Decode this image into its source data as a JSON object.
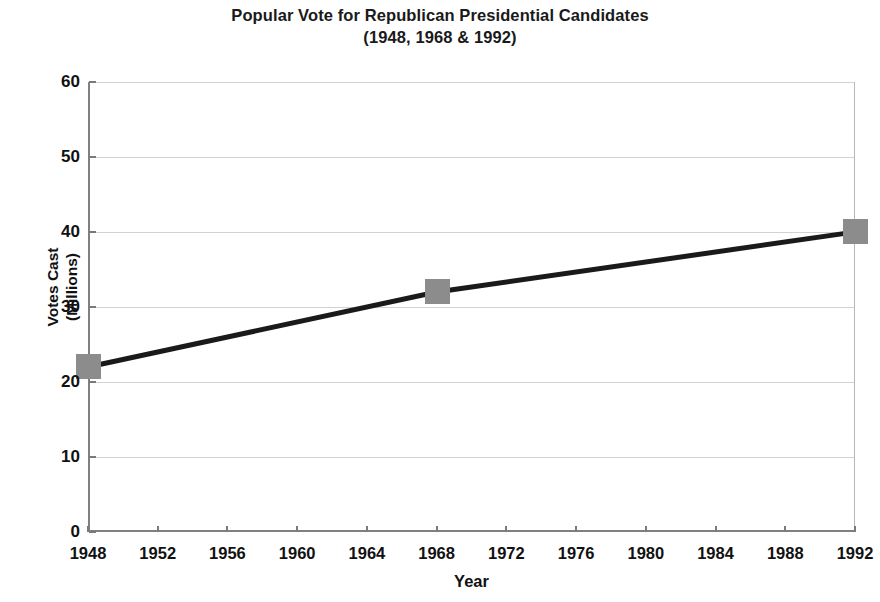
{
  "chart_data": {
    "type": "line",
    "title": "Popular Vote for Republican Presidential Candidates",
    "subtitle": "(1948, 1968 & 1992)",
    "xlabel": "Year",
    "ylabel": "Votes Cast",
    "ylabel_line2": "(Millions)",
    "x": [
      1948,
      1968,
      1992
    ],
    "values": [
      22,
      32,
      40
    ],
    "series": [
      {
        "name": "Votes Cast (Millions)",
        "x": [
          1948,
          1968,
          1992
        ],
        "values": [
          22,
          32,
          40
        ]
      }
    ],
    "xlim": [
      1948,
      1992
    ],
    "ylim": [
      0,
      60
    ],
    "ytick_labels": [
      "0",
      "10",
      "20",
      "30",
      "40",
      "50",
      "60"
    ],
    "ytick_values": [
      0,
      10,
      20,
      30,
      40,
      50,
      60
    ],
    "xtick_labels": [
      "1948",
      "1952",
      "1956",
      "1960",
      "1964",
      "1968",
      "1972",
      "1976",
      "1980",
      "1984",
      "1988",
      "1992"
    ],
    "xtick_values": [
      1948,
      1952,
      1956,
      1960,
      1964,
      1968,
      1972,
      1976,
      1980,
      1984,
      1988,
      1992
    ],
    "grid": "horizontal",
    "legend": "none",
    "line_color": "#1a1a1a",
    "marker_color": "#8c8c8c",
    "marker_shape": "square",
    "grid_color": "#d2d2d2",
    "background_color": "#ffffff"
  }
}
